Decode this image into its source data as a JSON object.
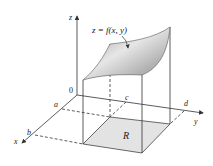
{
  "diagram": {
    "title": "",
    "surface_label": "z = f(x, y)",
    "region_label": "R",
    "axes": {
      "x": "x",
      "y": "y",
      "z": "z",
      "origin": "0"
    },
    "bounds": {
      "a": "a",
      "b": "b",
      "c": "c",
      "d": "d"
    },
    "colors": {
      "line": "#333333",
      "surface_light": "#eeeeee",
      "surface_dark": "#8f8f8f",
      "region_fill": "#e3e3e3"
    }
  }
}
